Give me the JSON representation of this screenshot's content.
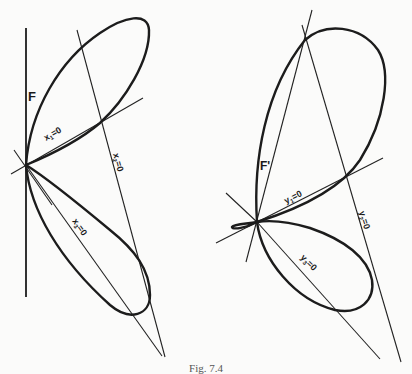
{
  "figure": {
    "caption": "Fig. 7.4",
    "left": {
      "curve_label": "F",
      "lines": [
        {
          "label": "x₁=0",
          "main": "x",
          "sub": "1",
          "rest": "=0"
        },
        {
          "label": "x₂=0",
          "main": "x",
          "sub": "2",
          "rest": "=0"
        },
        {
          "label": "x₃=0",
          "main": "x",
          "sub": "3",
          "rest": "=0"
        }
      ]
    },
    "right": {
      "curve_label": "F'",
      "lines": [
        {
          "label": "y₁=0",
          "main": "y",
          "sub": "1",
          "rest": "=0"
        },
        {
          "label": "y₂=0",
          "main": "y",
          "sub": "2",
          "rest": "=0"
        },
        {
          "label": "y₃=0",
          "main": "y",
          "sub": "3",
          "rest": "=0"
        }
      ]
    },
    "stroke_color": "#1c1c1c",
    "background": "#fbfbfa"
  }
}
